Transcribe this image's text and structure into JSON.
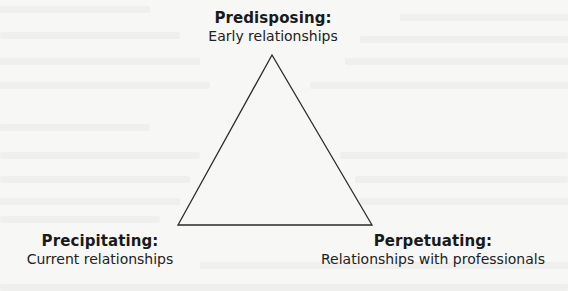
{
  "diagram": {
    "type": "triangle",
    "colors": {
      "background": "#f7f7f5",
      "stroke": "#2a2a2a",
      "text": "#1e1e1e"
    },
    "vertices": {
      "top": [
        272,
        55
      ],
      "bottom_left": [
        178,
        225
      ],
      "bottom_right": [
        372,
        225
      ]
    },
    "nodes": {
      "top": {
        "title": "Predisposing:",
        "subtitle": "Early relationships"
      },
      "bottom_left": {
        "title": "Precipitating:",
        "subtitle": "Current relationships"
      },
      "bottom_right": {
        "title": "Perpetuating:",
        "subtitle": "Relationships with professionals"
      }
    }
  }
}
